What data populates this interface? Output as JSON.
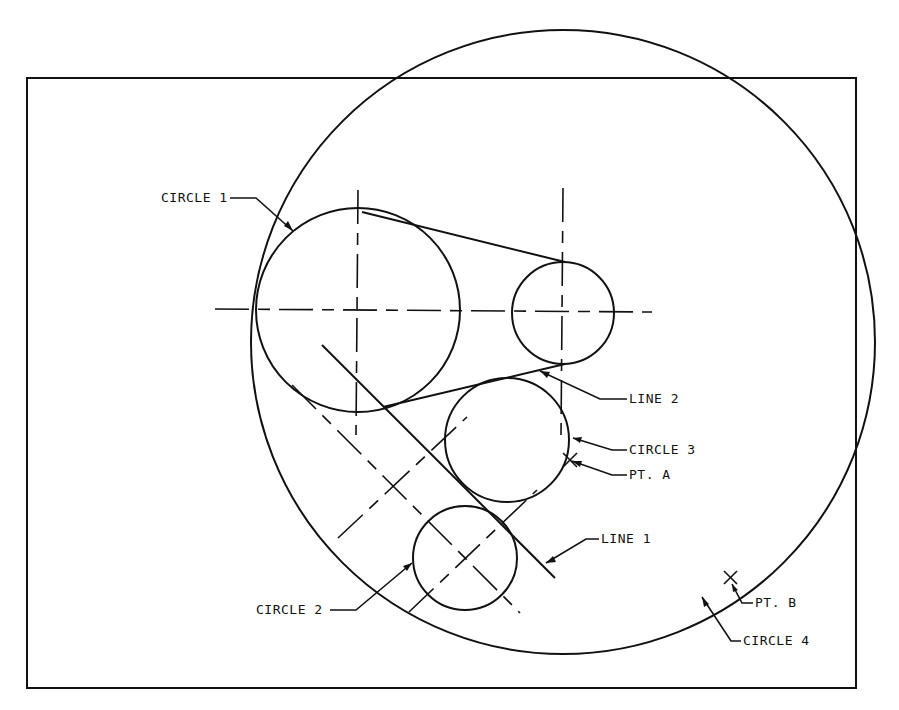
{
  "figure": {
    "type": "geometric construction drawing",
    "frame": {
      "x": 27,
      "y": 78,
      "width": 829,
      "height": 610
    },
    "colors": {
      "ink": "#111111",
      "paper": "#ffffff"
    }
  },
  "labels": {
    "circle1": "CIRCLE 1",
    "circle2": "CIRCLE 2",
    "circle3": "CIRCLE 3",
    "circle4": "CIRCLE 4",
    "line1": "LINE 1",
    "line2": "LINE 2",
    "pt_a": "PT. A",
    "pt_b": "PT. B"
  },
  "elements": {
    "circles": [
      {
        "name": "CIRCLE 1",
        "cx": 358,
        "cy": 310,
        "r": 102
      },
      {
        "name": "small circle",
        "cx": 563,
        "cy": 313,
        "r": 51
      },
      {
        "name": "CIRCLE 3",
        "cx": 507,
        "cy": 440,
        "r": 62
      },
      {
        "name": "CIRCLE 2",
        "cx": 465,
        "cy": 558,
        "r": 52
      },
      {
        "name": "CIRCLE 4",
        "cx": 563,
        "cy": 342,
        "r": 312
      }
    ],
    "lines": [
      {
        "name": "LINE 1",
        "x1": 322,
        "y1": 345,
        "x2": 555,
        "y2": 578
      },
      {
        "name": "LINE 2",
        "x1": 383,
        "y1": 405,
        "x2": 565,
        "y2": 362
      }
    ],
    "points": [
      {
        "name": "PT. A",
        "x": 570,
        "y": 460
      },
      {
        "name": "PT. B",
        "x": 730,
        "y": 578
      }
    ]
  }
}
